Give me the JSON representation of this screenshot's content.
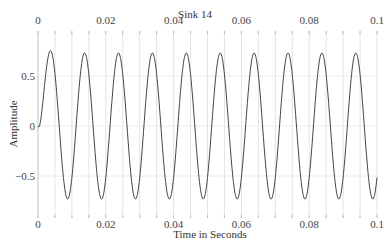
{
  "chart_data": {
    "type": "line",
    "title": "Sink 14",
    "xlabel": "Time in Seconds",
    "ylabel": "Amplitude",
    "xlim": [
      0,
      0.1
    ],
    "ylim": [
      -0.95,
      0.95
    ],
    "x_ticks": [
      0,
      0.02,
      0.04,
      0.06,
      0.08,
      0.1
    ],
    "x_tick_labels": [
      "0",
      "0.02",
      "0.04",
      "0.06",
      "0.08",
      "0.1"
    ],
    "x_top_tick_labels": [
      "0",
      "0.02",
      "0.04",
      "0.06",
      "0.08",
      "0.1"
    ],
    "y_ticks": [
      0.5,
      0,
      -0.5
    ],
    "y_tick_labels": [
      "0.5",
      "0",
      "-0.5"
    ],
    "grid": true,
    "vertical_grid_step": 0.005,
    "series": [
      {
        "name": "Sink 14",
        "description": "Sinusoid starting at 0 with initial transient, ~100 Hz, amplitude ~0.73",
        "frequency_hz": 100,
        "amplitude": 0.73,
        "phase_deg": -45,
        "offset": 0,
        "x_start": 0,
        "x_end": 0.1,
        "color": "#444444"
      }
    ]
  }
}
